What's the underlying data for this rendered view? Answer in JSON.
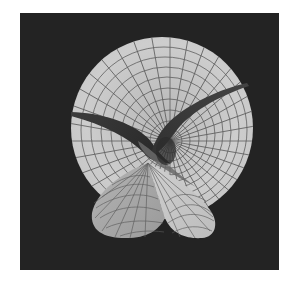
{
  "image": {
    "subject": "rendered minimal surface (wireframe-shaded)",
    "background_color": "#ffffff",
    "panel_color": "#232323",
    "surface_light": "#c9c9c9",
    "surface_mid": "#a8a8a8",
    "surface_dark": "#3a3a3a",
    "grid_line_color": "#5a5a5a"
  }
}
